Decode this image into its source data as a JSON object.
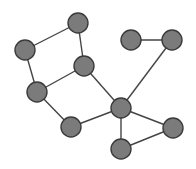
{
  "diagram": {
    "type": "undirected-graph",
    "style": {
      "node_fill": "#7b7b7b",
      "node_stroke": "#3a3a3a",
      "edge_color": "#444444",
      "background": "#ffffff"
    },
    "nodes": [
      {
        "id": "n1"
      },
      {
        "id": "n2"
      },
      {
        "id": "n3"
      },
      {
        "id": "n4"
      },
      {
        "id": "n5"
      },
      {
        "id": "n6"
      },
      {
        "id": "n7"
      },
      {
        "id": "n8"
      },
      {
        "id": "n9"
      },
      {
        "id": "n10"
      }
    ],
    "edges": [
      [
        "n2",
        "n1"
      ],
      [
        "n1",
        "n3"
      ],
      [
        "n2",
        "n4"
      ],
      [
        "n4",
        "n3"
      ],
      [
        "n4",
        "n5"
      ],
      [
        "n5",
        "n6"
      ],
      [
        "n3",
        "n6"
      ],
      [
        "n6",
        "n8"
      ],
      [
        "n7",
        "n8"
      ],
      [
        "n6",
        "n9"
      ],
      [
        "n6",
        "n10"
      ],
      [
        "n9",
        "n10"
      ]
    ]
  }
}
